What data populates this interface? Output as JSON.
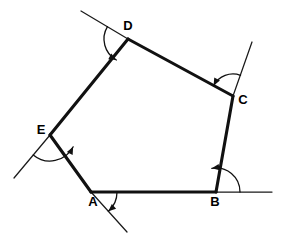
{
  "figure": {
    "background_color": "#ffffff",
    "edge_color": "#111111",
    "extension_color": "#1a1a1a",
    "label_color": "#000000",
    "canvas": {
      "width": 282,
      "height": 250
    },
    "vertices": [
      {
        "id": "A",
        "label": "A",
        "x": 91,
        "y": 192,
        "label_x": 93,
        "label_y": 203
      },
      {
        "id": "B",
        "label": "B",
        "x": 216,
        "y": 192,
        "label_x": 215,
        "label_y": 203
      },
      {
        "id": "C",
        "label": "C",
        "x": 233,
        "y": 96,
        "label_x": 243,
        "label_y": 101
      },
      {
        "id": "D",
        "label": "D",
        "x": 128,
        "y": 39,
        "label_x": 128,
        "label_y": 27
      },
      {
        "id": "E",
        "label": "E",
        "x": 50,
        "y": 135,
        "label_x": 41,
        "label_y": 131
      }
    ],
    "edges": [
      {
        "id": "AB",
        "from": "A",
        "to": "B"
      },
      {
        "id": "BC",
        "from": "B",
        "to": "C"
      },
      {
        "id": "CD",
        "from": "C",
        "to": "D"
      },
      {
        "id": "DE",
        "from": "D",
        "to": "E"
      },
      {
        "id": "EA",
        "from": "E",
        "to": "A"
      }
    ],
    "extension_lines": [
      {
        "id": "ext-ab-right",
        "at": "B",
        "x1": 91,
        "y1": 192,
        "x2": 272,
        "y2": 192
      },
      {
        "id": "ext-ea-beyond-a",
        "at": "A",
        "x1": 91,
        "y1": 192,
        "x2": 127,
        "y2": 232
      },
      {
        "id": "ext-de-beyond-e",
        "at": "E",
        "x1": 50,
        "y1": 135,
        "x2": 14,
        "y2": 178
      },
      {
        "id": "ext-cd-beyond-d",
        "at": "D",
        "x1": 128,
        "y1": 39,
        "x2": 81,
        "y2": 11
      },
      {
        "id": "ext-bc-beyond-c",
        "at": "C",
        "x1": 233,
        "y1": 96,
        "x2": 252,
        "y2": 42
      }
    ],
    "angle_arcs": [
      {
        "id": "arc-A",
        "vertex": "A",
        "radius": 26,
        "start_deg": 0,
        "end_deg": -48
      },
      {
        "id": "arc-B",
        "vertex": "B",
        "radius": 24,
        "start_deg": 0,
        "end_deg": 100
      },
      {
        "id": "arc-C",
        "vertex": "C",
        "radius": 22,
        "start_deg": 70,
        "end_deg": 152
      },
      {
        "id": "arc-D",
        "vertex": "D",
        "radius": 24,
        "start_deg": 149,
        "end_deg": 241
      },
      {
        "id": "arc-E",
        "vertex": "E",
        "radius": 26,
        "start_deg": 230,
        "end_deg": 333
      }
    ]
  }
}
